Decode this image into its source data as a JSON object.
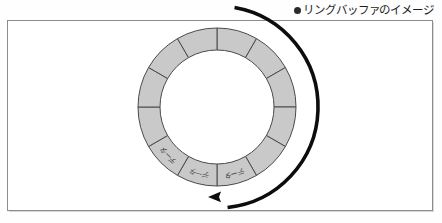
{
  "caption": {
    "bullet_icon": "bullet-dot-icon",
    "text": "リングバッファのイメージ"
  },
  "diagram": {
    "colors": {
      "segment_fill": "#c9c9c9",
      "segment_stroke": "#4a4a4a",
      "arrow": "#0d0d0d",
      "frame_border": "#8d8d8d",
      "background": "#ffffff",
      "label_text": "#3a3a3a"
    },
    "ring": {
      "center_x": 217,
      "center_y": 107,
      "outer_radius": 79,
      "inner_radius": 57,
      "segment_count": 12,
      "segment_angle_deg": 30,
      "start_angle_deg": -90
    },
    "segments": [
      {
        "index": 0,
        "label": ""
      },
      {
        "index": 1,
        "label": ""
      },
      {
        "index": 2,
        "label": ""
      },
      {
        "index": 3,
        "label": ""
      },
      {
        "index": 4,
        "label": ""
      },
      {
        "index": 5,
        "label": "データ"
      },
      {
        "index": 6,
        "label": "データ"
      },
      {
        "index": 7,
        "label": "データ"
      },
      {
        "index": 8,
        "label": ""
      },
      {
        "index": 9,
        "label": ""
      },
      {
        "index": 10,
        "label": ""
      },
      {
        "index": 11,
        "label": ""
      }
    ],
    "arrow": {
      "name": "rotation-arrow",
      "direction": "counterclockwise",
      "radius": 101,
      "start_angle_deg": -80,
      "end_angle_deg": 84,
      "tip_x": 208,
      "tip_y": 197
    }
  }
}
